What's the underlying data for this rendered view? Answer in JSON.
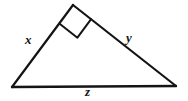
{
  "figure": {
    "kind": "right-triangle-diagram",
    "background_color": "#ffffff",
    "stroke_color": "#141414",
    "stroke_width": 2.2,
    "canvas": {
      "width": 188,
      "height": 101
    }
  },
  "vertices": {
    "apex": {
      "name": "right-angle-vertex",
      "x": 73,
      "y": 5
    },
    "bottom_left": {
      "name": "left-vertex",
      "x": 12,
      "y": 87
    },
    "bottom_right": {
      "name": "right-vertex",
      "x": 176,
      "y": 86
    }
  },
  "sides": [
    {
      "id": "x",
      "name": "side-x",
      "label": "x",
      "from": "bottom_left",
      "to": "apex"
    },
    {
      "id": "y",
      "name": "side-y",
      "label": "y",
      "from": "apex",
      "to": "bottom_right"
    },
    {
      "id": "z",
      "name": "side-z",
      "label": "z",
      "from": "bottom_left",
      "to": "bottom_right"
    }
  ],
  "labels": {
    "x": "x",
    "y": "y",
    "z": "z"
  },
  "right_angle_marker": {
    "name": "right-angle-square-icon",
    "at_vertex": "apex",
    "size": 23,
    "description": "small square drawn inside the apex indicating a 90 degree angle"
  }
}
